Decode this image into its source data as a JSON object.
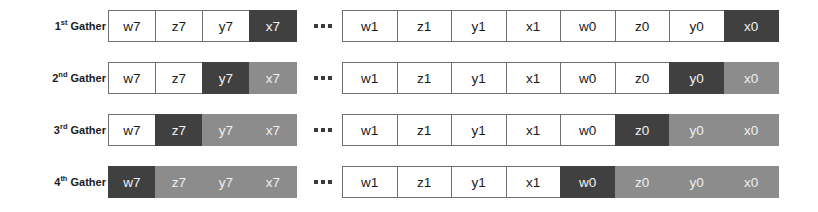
{
  "diagram": {
    "colors": {
      "dark": "#404040",
      "light": "#8c8c8c",
      "plain": "#ffffff",
      "border": "#6e6e6e",
      "background": "#ffffff",
      "text_dark": "#1a1a1a",
      "text_light": "#f0f0f0"
    },
    "separator": "···",
    "rows": [
      {
        "label_number": "1",
        "label_ordinal": "st",
        "label_word": "Gather",
        "label_full": "1st Gather",
        "left_group": [
          {
            "text": "w7",
            "shade": "plain"
          },
          {
            "text": "z7",
            "shade": "plain"
          },
          {
            "text": "y7",
            "shade": "plain"
          },
          {
            "text": "x7",
            "shade": "dark"
          }
        ],
        "right_group": [
          {
            "text": "w1",
            "shade": "plain"
          },
          {
            "text": "z1",
            "shade": "plain"
          },
          {
            "text": "y1",
            "shade": "plain"
          },
          {
            "text": "x1",
            "shade": "plain"
          },
          {
            "text": "w0",
            "shade": "plain"
          },
          {
            "text": "z0",
            "shade": "plain"
          },
          {
            "text": "y0",
            "shade": "plain"
          },
          {
            "text": "x0",
            "shade": "dark"
          }
        ]
      },
      {
        "label_number": "2",
        "label_ordinal": "nd",
        "label_word": "Gather",
        "label_full": "2nd Gather",
        "left_group": [
          {
            "text": "w7",
            "shade": "plain"
          },
          {
            "text": "z7",
            "shade": "plain"
          },
          {
            "text": "y7",
            "shade": "dark"
          },
          {
            "text": "x7",
            "shade": "light"
          }
        ],
        "right_group": [
          {
            "text": "w1",
            "shade": "plain"
          },
          {
            "text": "z1",
            "shade": "plain"
          },
          {
            "text": "y1",
            "shade": "plain"
          },
          {
            "text": "x1",
            "shade": "plain"
          },
          {
            "text": "w0",
            "shade": "plain"
          },
          {
            "text": "z0",
            "shade": "plain"
          },
          {
            "text": "y0",
            "shade": "dark"
          },
          {
            "text": "x0",
            "shade": "light"
          }
        ]
      },
      {
        "label_number": "3",
        "label_ordinal": "rd",
        "label_word": "Gather",
        "label_full": "3rd Gather",
        "left_group": [
          {
            "text": "w7",
            "shade": "plain"
          },
          {
            "text": "z7",
            "shade": "dark"
          },
          {
            "text": "y7",
            "shade": "light"
          },
          {
            "text": "x7",
            "shade": "light"
          }
        ],
        "right_group": [
          {
            "text": "w1",
            "shade": "plain"
          },
          {
            "text": "z1",
            "shade": "plain"
          },
          {
            "text": "y1",
            "shade": "plain"
          },
          {
            "text": "x1",
            "shade": "plain"
          },
          {
            "text": "w0",
            "shade": "plain"
          },
          {
            "text": "z0",
            "shade": "dark"
          },
          {
            "text": "y0",
            "shade": "light"
          },
          {
            "text": "x0",
            "shade": "light"
          }
        ]
      },
      {
        "label_number": "4",
        "label_ordinal": "th",
        "label_word": "Gather",
        "label_full": "4th Gather",
        "left_group": [
          {
            "text": "w7",
            "shade": "dark"
          },
          {
            "text": "z7",
            "shade": "light"
          },
          {
            "text": "y7",
            "shade": "light"
          },
          {
            "text": "x7",
            "shade": "light"
          }
        ],
        "right_group": [
          {
            "text": "w1",
            "shade": "plain"
          },
          {
            "text": "z1",
            "shade": "plain"
          },
          {
            "text": "y1",
            "shade": "plain"
          },
          {
            "text": "x1",
            "shade": "plain"
          },
          {
            "text": "w0",
            "shade": "dark"
          },
          {
            "text": "z0",
            "shade": "light"
          },
          {
            "text": "y0",
            "shade": "light"
          },
          {
            "text": "x0",
            "shade": "light"
          }
        ]
      }
    ]
  }
}
